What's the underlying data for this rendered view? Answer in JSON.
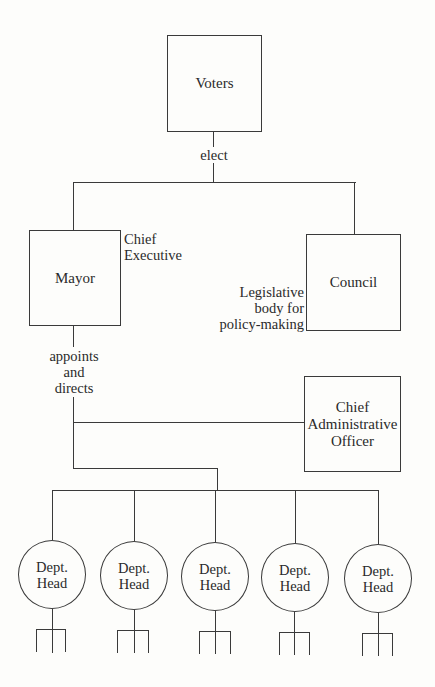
{
  "diagram": {
    "nodes": {
      "voters": {
        "label": "Voters"
      },
      "mayor": {
        "label": "Mayor"
      },
      "council": {
        "label": "Council"
      },
      "cao": {
        "label": "Chief\nAdministrative\nOfficer"
      }
    },
    "edges": {
      "elect": "elect",
      "appoints": "appoints\nand\ndirects"
    },
    "annotations": {
      "mayor_role": "Chief\nExecutive",
      "council_role": "Legislative\nbody for\npolicy-making"
    },
    "dept_heads": [
      {
        "line1": "Dept.",
        "line2": "Head"
      },
      {
        "line1": "Dept.",
        "line2": "Head"
      },
      {
        "line1": "Dept.",
        "line2": "Head"
      },
      {
        "line1": "Dept.",
        "line2": "Head"
      },
      {
        "line1": "Dept.",
        "line2": "Head"
      }
    ],
    "colors": {
      "stroke": "#3a3a3a",
      "background": "#fdfdfb",
      "text": "#2a2a2a"
    }
  }
}
